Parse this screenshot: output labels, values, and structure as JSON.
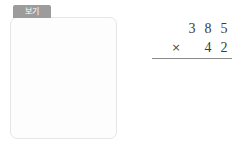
{
  "tab": {
    "label": "보기"
  },
  "example": {
    "name": "worked-example",
    "multiplicand": "516",
    "multiplier": "78",
    "operator": "×",
    "partial_product_1": "4128",
    "partial_product_2": "3612",
    "total": "40248",
    "rows": [
      {
        "name": "multiplicand-row",
        "cells": [
          "",
          "",
          "5",
          "1",
          "6"
        ]
      },
      {
        "name": "multiplier-row",
        "cells": [
          "",
          "×",
          "",
          "7",
          "8"
        ]
      },
      {
        "name": "partial-1-row",
        "cells": [
          "",
          "4",
          "1",
          "2",
          "8"
        ]
      },
      {
        "name": "partial-2-row",
        "cells": [
          "3",
          "6",
          "1",
          "2",
          ""
        ]
      },
      {
        "name": "total-row",
        "cells": [
          "4",
          "0",
          "2",
          "4",
          "8"
        ]
      }
    ]
  },
  "problem": {
    "name": "blank-problem",
    "multiplicand": "385",
    "multiplier": "42",
    "operator": "×",
    "answer": "",
    "rows": [
      {
        "name": "multiplicand-row",
        "cells": [
          "",
          "",
          "3",
          "8",
          "5"
        ]
      },
      {
        "name": "multiplier-row",
        "cells": [
          "",
          "×",
          "",
          "4",
          "2"
        ]
      },
      {
        "name": "answer-row",
        "cells": [
          "",
          "",
          "",
          "",
          ""
        ]
      }
    ]
  },
  "colors": {
    "tab_background": "#9c9c9c",
    "tab_text": "#ffffff",
    "card_background": "#fdfdfd",
    "card_border": "#e6e6e6",
    "digit_text": "#3c3c3c",
    "rule_line": "#8a8a8a",
    "page_background": "#ffffff"
  }
}
